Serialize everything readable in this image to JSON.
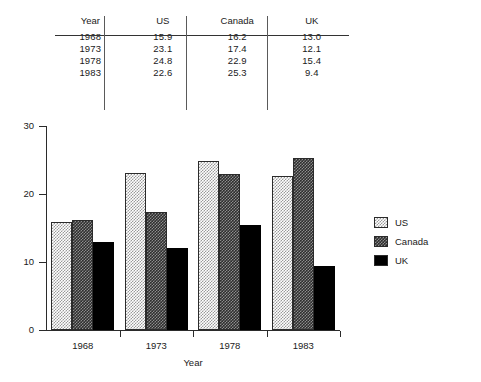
{
  "table": {
    "headers": [
      "Year",
      "US",
      "Canada",
      "UK"
    ],
    "rows": [
      [
        "1968",
        "15.9",
        "16.2",
        "13.0"
      ],
      [
        "1973",
        "23.1",
        "17.4",
        "12.1"
      ],
      [
        "1978",
        "24.8",
        "22.9",
        "15.4"
      ],
      [
        "1983",
        "22.6",
        "25.3",
        "9.4"
      ]
    ]
  },
  "chart_data": {
    "type": "bar",
    "title": "",
    "xlabel": "Year",
    "ylabel": "",
    "categories": [
      "1968",
      "1973",
      "1978",
      "1983"
    ],
    "series": [
      {
        "name": "US",
        "values": [
          15.9,
          23.1,
          24.8,
          22.6
        ],
        "pattern": "light-checkerboard",
        "color": "#d0d0d0"
      },
      {
        "name": "Canada",
        "values": [
          16.2,
          17.4,
          22.9,
          25.3
        ],
        "pattern": "dark-checkerboard",
        "color": "#4a4a4a"
      },
      {
        "name": "UK",
        "values": [
          13.0,
          12.1,
          15.4,
          9.4
        ],
        "pattern": "solid",
        "color": "#000000"
      }
    ],
    "ylim": [
      0,
      30
    ],
    "yticks": [
      "0",
      "10",
      "20",
      "30"
    ],
    "xticks": [
      "1968",
      "1973",
      "1978",
      "1983"
    ],
    "grid": false,
    "legend_position": "right"
  },
  "legend": {
    "entries": [
      {
        "label": "US"
      },
      {
        "label": "Canada"
      },
      {
        "label": "UK"
      }
    ]
  },
  "axis": {
    "x_title": "Year"
  }
}
